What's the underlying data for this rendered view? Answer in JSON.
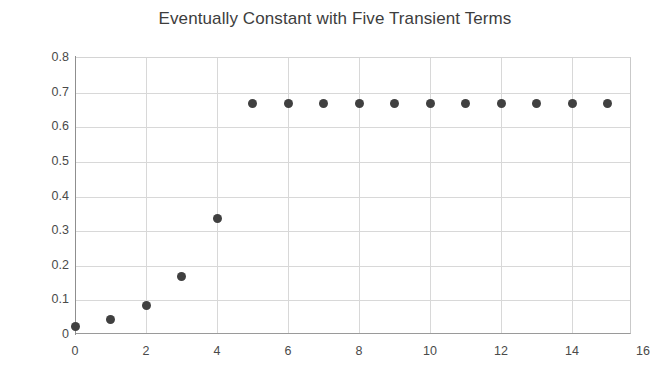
{
  "chart_data": {
    "type": "scatter",
    "title": "Eventually Constant with Five Transient Terms",
    "xlabel": "",
    "ylabel": "",
    "x": [
      0,
      1,
      2,
      3,
      4,
      5,
      6,
      7,
      8,
      9,
      10,
      11,
      12,
      13,
      14,
      15
    ],
    "values": [
      0.0208,
      0.0417,
      0.0833,
      0.1667,
      0.3333,
      0.6667,
      0.6667,
      0.6667,
      0.6667,
      0.6667,
      0.6667,
      0.6667,
      0.6667,
      0.6667,
      0.6667,
      0.6667
    ],
    "series": [
      {
        "name": "sequence",
        "values": [
          0.0208,
          0.0417,
          0.0833,
          0.1667,
          0.3333,
          0.6667,
          0.6667,
          0.6667,
          0.6667,
          0.6667,
          0.6667,
          0.6667,
          0.6667,
          0.6667,
          0.6667,
          0.6667
        ]
      }
    ],
    "xlim": [
      0,
      16
    ],
    "ylim": [
      0,
      0.8
    ],
    "xticks": [
      0,
      2,
      4,
      6,
      8,
      10,
      12,
      14,
      16
    ],
    "xtick_labels": [
      "0",
      "2",
      "4",
      "6",
      "8",
      "10",
      "12",
      "14",
      "16"
    ],
    "yticks": [
      0,
      0.1,
      0.2,
      0.3,
      0.4,
      0.5,
      0.6,
      0.7,
      0.8
    ],
    "ytick_labels": [
      "0",
      "0.1",
      "0.2",
      "0.3",
      "0.4",
      "0.5",
      "0.6",
      "0.7",
      "0.8"
    ],
    "grid": true,
    "grid_axes": "both",
    "legend": false,
    "legend_position": "none",
    "marker": "circle",
    "marker_color": "#404040",
    "marker_size": 9,
    "grid_color": "#d8d8d8",
    "axis_color": "#8f8f8f",
    "title_color": "#3d3d3d",
    "background": "#ffffff",
    "transient_count": 5,
    "constant_value": 0.6667
  }
}
